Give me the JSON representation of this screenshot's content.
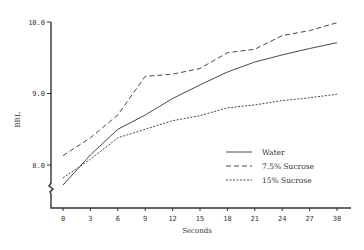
{
  "chart_data": {
    "type": "line",
    "title": "",
    "xlabel": "Seconds",
    "ylabel": "BRL",
    "x": [
      0,
      3,
      6,
      9,
      12,
      15,
      18,
      21,
      24,
      27,
      30
    ],
    "x_ticks": [
      "0",
      "3",
      "6",
      "9",
      "12",
      "15",
      "18",
      "21",
      "24",
      "27",
      "30"
    ],
    "y_ticks": [
      "8.0",
      "9.0",
      "10.0"
    ],
    "ylim": [
      7.65,
      10.0
    ],
    "xlim": [
      -1.3,
      31.5
    ],
    "axis_break": "y",
    "grid": false,
    "legend_position": "lower right",
    "series": [
      {
        "name": "Water",
        "style": "solid",
        "values": [
          7.72,
          8.14,
          8.5,
          8.7,
          8.93,
          9.12,
          9.3,
          9.44,
          9.54,
          9.63,
          9.71
        ]
      },
      {
        "name": "7.5% Sucrose",
        "style": "dashed",
        "values": [
          8.13,
          8.38,
          8.7,
          9.24,
          9.27,
          9.35,
          9.57,
          9.62,
          9.81,
          9.88,
          9.99
        ]
      },
      {
        "name": "15% Sucrose",
        "style": "dotted",
        "values": [
          7.82,
          8.08,
          8.38,
          8.5,
          8.62,
          8.69,
          8.8,
          8.84,
          8.9,
          8.94,
          8.99
        ]
      }
    ]
  },
  "labels": {
    "xlabel": "Seconds",
    "ylabel": "BRL"
  },
  "colors": {
    "line": "#333333",
    "background": "#ffffff"
  }
}
